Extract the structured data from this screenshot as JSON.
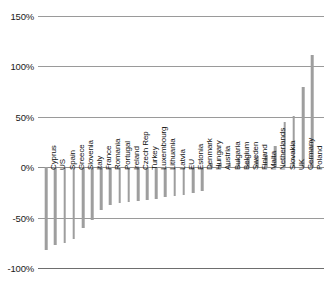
{
  "chart_data": {
    "type": "bar",
    "title": "",
    "subtitle": "",
    "xlabel": "",
    "ylabel": "",
    "ylim": [
      -100,
      150
    ],
    "ytick_values": [
      150,
      100,
      50,
      0,
      -50,
      -100
    ],
    "ytick_labels": [
      "150%",
      "100%",
      "50%",
      "0%",
      "-50%",
      "-100%"
    ],
    "grid": true,
    "legend": "none",
    "orientation": "vertical",
    "bar_color": "#9e9e9e",
    "categories": [
      "Cyprus",
      "US",
      "Spain",
      "Greece",
      "Slovenia",
      "Italy",
      "France",
      "Romania",
      "Portugal",
      "Ireland",
      "Czech Rep",
      "Turkey",
      "Luxembourg",
      "Lithuania",
      "Latvia",
      "EU",
      "Estonia",
      "Denmark",
      "Hungary",
      "Austria",
      "Bulgaria",
      "Belgium",
      "Sweden",
      "Finland",
      "Malta",
      "Netherlands",
      "Slovakia",
      "UK",
      "Germany",
      "Poland"
    ],
    "values": [
      -82,
      -77,
      -75,
      -71,
      -60,
      -52,
      -42,
      -38,
      -36,
      -35,
      -34,
      -33,
      -32,
      -30,
      -29,
      -28,
      -26,
      -24,
      4,
      4,
      4,
      9,
      10,
      11,
      12,
      21,
      45,
      51,
      80,
      111
    ]
  },
  "axis": {
    "y_label_suffix": "%"
  }
}
